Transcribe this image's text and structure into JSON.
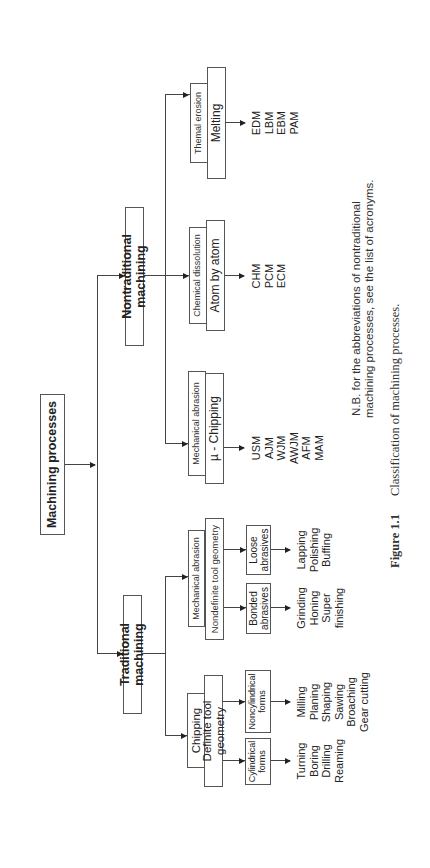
{
  "diagram": {
    "root": {
      "label": "Machining processes"
    },
    "branches": {
      "nontraditional": {
        "label": "Nontraditional machining",
        "children": [
          {
            "category": "Themal erosion",
            "mechanism": "Melting",
            "processes": [
              "EDM",
              "LBM",
              "EBM",
              "PAM"
            ]
          },
          {
            "category": "Chemical dissolution",
            "mechanism": "Atom by atom",
            "processes": [
              "CHM",
              "PCM",
              "ECM"
            ]
          },
          {
            "category": "Mechanical abrasion",
            "mechanism": "µ - Chipping",
            "processes": [
              "USM",
              "AJM",
              "WJM",
              "AWJM",
              "AFM",
              "MAM"
            ]
          }
        ]
      },
      "traditional": {
        "label": "Traditional machining",
        "children": [
          {
            "category": "Mechanical abrasion",
            "mechanism": "Nondefinite tool geometry",
            "subgroups": [
              {
                "label_line1": "Loose",
                "label_line2": "abrasives",
                "processes": [
                  "Lapping",
                  "Polishing",
                  "Buffing"
                ]
              },
              {
                "label_line1": "Bonded",
                "label_line2": "abrasives",
                "processes": [
                  "Grinding",
                  "Honing",
                  "Super",
                  "finishing"
                ]
              }
            ]
          },
          {
            "category": "Chipping",
            "mechanism": "Definite tool geometry",
            "subgroups": [
              {
                "label_line1": "Noncylindrical",
                "label_line2": "forms",
                "processes": [
                  "Milling",
                  "Planing",
                  "Shaping",
                  "Sawing",
                  "Broaching",
                  "Gear cutting"
                ]
              },
              {
                "label_line1": "Cylindrical",
                "label_line2": "forms",
                "processes": [
                  "Turning",
                  "Boring",
                  "Drilling",
                  "Reaming"
                ]
              }
            ]
          }
        ]
      }
    },
    "note": {
      "line1": "N.B. for the abbreviations of nontraditional",
      "line2": "machining processes, see the list of acronyms."
    },
    "caption": {
      "figure_label": "Figure 1.1",
      "text": "Classification of machining processes."
    }
  }
}
